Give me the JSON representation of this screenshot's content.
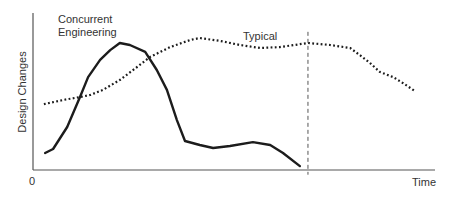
{
  "chart_data": {
    "type": "line",
    "title": "",
    "xlabel": "Time",
    "ylabel": "Design Changes",
    "x_origin_label": "0",
    "xlim": [
      0,
      100
    ],
    "ylim": [
      0,
      100
    ],
    "grid": false,
    "legend": "inline labels",
    "series": [
      {
        "name": "Concurrent Engineering",
        "label_lines": [
          "Concurrent",
          "Engineering"
        ],
        "style": "solid",
        "color": "#1c1c1c",
        "x": [
          3.0,
          5.0,
          8.5,
          11.7,
          13.7,
          16.7,
          19.2,
          21.6,
          24.1,
          27.9,
          30.8,
          33.3,
          35.8,
          37.8,
          41.5,
          44.8,
          49.0,
          54.7,
          59.0,
          62.2,
          66.4
        ],
        "y": [
          10.8,
          13.4,
          27.4,
          46.5,
          59.2,
          70.1,
          76.4,
          80.9,
          79.6,
          75.2,
          63.7,
          51.0,
          31.8,
          18.5,
          15.9,
          14.0,
          15.3,
          17.8,
          15.9,
          10.8,
          2.5
        ]
      },
      {
        "name": "Typical",
        "label_lines": [
          "Typical"
        ],
        "style": "dotted",
        "color": "#1c1c1c",
        "x": [
          2.7,
          7.5,
          11.7,
          14.2,
          17.4,
          21.6,
          25.9,
          29.1,
          34.1,
          39.1,
          41.5,
          46.5,
          51.5,
          56.5,
          61.4,
          68.4,
          73.9,
          78.9,
          81.3,
          83.8,
          86.3,
          89.6,
          92.0,
          95.0
        ],
        "y": [
          42.0,
          44.6,
          46.5,
          47.8,
          51.0,
          57.3,
          65.6,
          72.0,
          78.3,
          82.8,
          84.1,
          82.2,
          79.6,
          77.7,
          78.3,
          80.9,
          79.6,
          77.7,
          73.2,
          68.2,
          62.4,
          59.2,
          55.4,
          50.3
        ]
      }
    ],
    "annotations": [
      {
        "type": "vertical-dashed-line",
        "x": 68.4,
        "y_from": -3,
        "y_to": 88
      }
    ]
  },
  "labels": {
    "concurrent_line1": "Concurrent",
    "concurrent_line2": "Engineering",
    "typical": "Typical",
    "xlabel": "Time",
    "ylabel": "Design Changes",
    "origin": "0"
  }
}
